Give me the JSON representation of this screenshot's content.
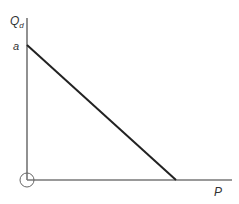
{
  "diagram": {
    "type": "linear demand curve",
    "y_axis": {
      "label": "Q",
      "label_sub": "d"
    },
    "x_axis": {
      "label": "P"
    },
    "intercept_label": "a",
    "colors": {
      "axis": "#555555",
      "demand_line": "#222222",
      "text": "#333333",
      "origin_marker": "#555555"
    }
  }
}
